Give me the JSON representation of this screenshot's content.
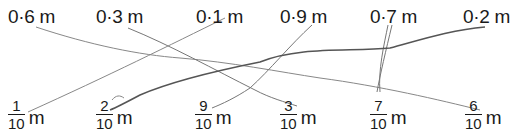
{
  "decimals": [
    {
      "label": "0·6 m",
      "value": "0·6",
      "unit": "m",
      "x": 8
    },
    {
      "label": "0·3 m",
      "value": "0·3",
      "unit": "m",
      "x": 96
    },
    {
      "label": "0·1 m",
      "value": "0·1",
      "unit": "m",
      "x": 196
    },
    {
      "label": "0·9 m",
      "value": "0·9",
      "unit": "m",
      "x": 280
    },
    {
      "label": "0·7 m",
      "value": "0·7",
      "unit": "m",
      "x": 370
    },
    {
      "label": "0·2 m",
      "value": "0·2",
      "unit": "m",
      "x": 463
    }
  ],
  "fractions": [
    {
      "numerator": "1",
      "denominator": "10",
      "unit": "m",
      "x": 8
    },
    {
      "numerator": "2",
      "denominator": "10",
      "unit": "m",
      "x": 96
    },
    {
      "numerator": "9",
      "denominator": "10",
      "unit": "m",
      "x": 195
    },
    {
      "numerator": "3",
      "denominator": "10",
      "unit": "m",
      "x": 280
    },
    {
      "numerator": "7",
      "denominator": "10",
      "unit": "m",
      "x": 370
    },
    {
      "numerator": "6",
      "denominator": "10",
      "unit": "m",
      "x": 465
    }
  ],
  "matches": [
    {
      "from": "0·6 m",
      "to": "6/10 m"
    },
    {
      "from": "0·3 m",
      "to": "3/10 m"
    },
    {
      "from": "0·1 m",
      "to": "1/10 m"
    },
    {
      "from": "0·9 m",
      "to": "9/10 m"
    },
    {
      "from": "0·7 m",
      "to": "7/10 m"
    },
    {
      "from": "0·2 m",
      "to": "2/10 m"
    }
  ],
  "line_color": "#777777"
}
